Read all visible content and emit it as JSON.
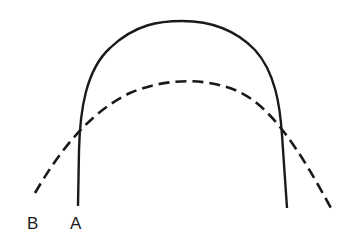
{
  "diagram": {
    "curves": [
      {
        "id": "A",
        "style": "solid",
        "description": "tall narrow arch"
      },
      {
        "id": "B",
        "style": "dashed",
        "description": "wide flat arch"
      }
    ],
    "labels": {
      "b": "B",
      "a": "A"
    },
    "colors": {
      "stroke": "#1a1a1a",
      "background": "#ffffff"
    }
  }
}
